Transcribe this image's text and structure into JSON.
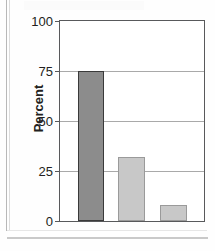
{
  "chart_data": {
    "type": "bar",
    "title": "",
    "xlabel": "",
    "ylabel": "Percent",
    "categories": [
      "Bar 1",
      "Bar 2",
      "Bar 3"
    ],
    "values": [
      75,
      32,
      8
    ],
    "ylim": [
      0,
      100
    ],
    "yticks": [
      0,
      25,
      50,
      75,
      100
    ],
    "ytick_labels": [
      "0",
      "25",
      "50",
      "75",
      "100"
    ],
    "grid": true,
    "legend": "none",
    "series": [
      {
        "name": "Percent",
        "values": [
          75,
          32,
          8
        ],
        "colors": [
          "#8c8c8c",
          "#c8c8c8",
          "#c8c8c8"
        ]
      }
    ]
  },
  "axes": {
    "y_label": "Percent",
    "ticks": [
      {
        "label": "100",
        "value": 100
      },
      {
        "label": "75",
        "value": 75
      },
      {
        "label": "50",
        "value": 50
      },
      {
        "label": "25",
        "value": 25
      },
      {
        "label": "0",
        "value": 0
      }
    ]
  },
  "colors": {
    "bar_dark": "#8c8c8c",
    "bar_dark_outline": "#3a3a3a",
    "bar_light": "#c8c8c8",
    "bar_light_outline": "#9a9a9a",
    "axis": "#58595b",
    "gridline": "#a9a9a9",
    "text": "#231f20"
  }
}
